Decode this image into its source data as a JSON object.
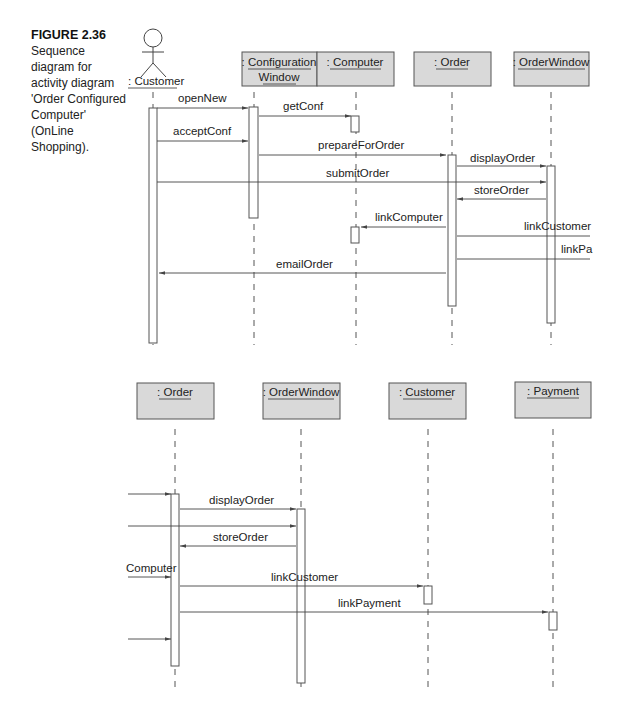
{
  "caption": {
    "figure": "FIGURE 2.36",
    "text": "Sequence diagram for activity diagram 'Order Configured Computer' (OnLine Shopping)."
  },
  "diagram_top": {
    "actor": {
      "label": ": Customer",
      "x": 140
    },
    "objects": [
      {
        "id": "configwin",
        "lines": [
          ": Configuration",
          "Window"
        ],
        "x": 254,
        "box": [
          242,
          52,
          75,
          34
        ]
      },
      {
        "id": "computer",
        "lines": [
          ": Computer"
        ],
        "x": 355,
        "box": [
          317,
          52,
          77,
          34
        ]
      },
      {
        "id": "order",
        "lines": [
          ": Order"
        ],
        "x": 452,
        "box": [
          414,
          52,
          77,
          34
        ]
      },
      {
        "id": "orderwindow",
        "lines": [
          ": OrderWindow"
        ],
        "x": 550,
        "box": [
          514,
          52,
          75,
          34
        ]
      }
    ],
    "messages": [
      {
        "label": "openNew",
        "from": 157,
        "to": 248,
        "y": 108,
        "lx": 178,
        "ly": 102
      },
      {
        "label": "getConf",
        "from": 259,
        "to": 351,
        "y": 116,
        "lx": 283,
        "ly": 110
      },
      {
        "label": "acceptConf",
        "from": 157,
        "to": 248,
        "y": 141,
        "lx": 173,
        "ly": 135
      },
      {
        "label": "prepareForOrder",
        "from": 259,
        "to": 446,
        "y": 155,
        "lx": 318,
        "ly": 149
      },
      {
        "label": "displayOrder",
        "from": 457,
        "to": 546,
        "y": 166,
        "lx": 470,
        "ly": 162
      },
      {
        "label": "submitOrder",
        "from": 157,
        "to": 546,
        "y": 182,
        "lx": 326,
        "ly": 177
      },
      {
        "label": "storeOrder",
        "from": 546,
        "to": 457,
        "y": 199,
        "lx": 474,
        "ly": 194
      },
      {
        "label": "linkComputer",
        "from": 446,
        "to": 361,
        "y": 227,
        "lx": 375,
        "ly": 221
      },
      {
        "label": "linkCustomer",
        "from": 457,
        "to": 590,
        "y": 236,
        "lx": 524,
        "ly": 230
      },
      {
        "label": "linkPa",
        "from": 457,
        "to": 590,
        "y": 259,
        "lx": 561,
        "ly": 253
      },
      {
        "label": "emailOrder",
        "from": 446,
        "to": 159,
        "y": 273,
        "lx": 276,
        "ly": 268
      }
    ]
  },
  "diagram_bottom": {
    "objects": [
      {
        "id": "order",
        "lines": [
          ": Order"
        ],
        "x": 174,
        "box": [
          137,
          383,
          77,
          36
        ]
      },
      {
        "id": "orderwindow",
        "lines": [
          ": OrderWindow"
        ],
        "x": 300,
        "box": [
          263,
          383,
          77,
          36
        ]
      },
      {
        "id": "customer",
        "lines": [
          ": Customer"
        ],
        "x": 427,
        "box": [
          389,
          383,
          77,
          36
        ]
      },
      {
        "id": "payment",
        "lines": [
          ": Payment"
        ],
        "x": 552,
        "box": [
          515,
          382,
          76,
          36
        ]
      }
    ],
    "messages": [
      {
        "label": "",
        "from": 128,
        "to": 171,
        "y": 494,
        "lx": 0,
        "ly": 0
      },
      {
        "label": "displayOrder",
        "from": 180,
        "to": 296,
        "y": 509,
        "lx": 209,
        "ly": 504
      },
      {
        "label": "",
        "from": 128,
        "to": 296,
        "y": 526,
        "lx": 0,
        "ly": 0
      },
      {
        "label": "storeOrder",
        "from": 296,
        "to": 180,
        "y": 546,
        "lx": 213,
        "ly": 541
      },
      {
        "label": "",
        "from": 128,
        "to": 171,
        "y": 577,
        "lx": 0,
        "ly": 0
      },
      {
        "label": "linkCustomer",
        "from": 180,
        "to": 423,
        "y": 586,
        "lx": 271,
        "ly": 581
      },
      {
        "label": "linkPayment",
        "from": 180,
        "to": 548,
        "y": 612,
        "lx": 338,
        "ly": 607
      },
      {
        "label": "",
        "from": 128,
        "to": 171,
        "y": 639,
        "lx": 0,
        "ly": 0
      }
    ],
    "fragment_label": {
      "text": "Computer",
      "x": 126,
      "y": 572
    }
  }
}
